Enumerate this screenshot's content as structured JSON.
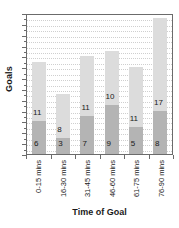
{
  "chart_data": {
    "type": "bar",
    "title": "",
    "subtitle": "",
    "xlabel": "Time of Goal",
    "ylabel": "Goals",
    "stacked": true,
    "orientation": "vertical",
    "grid": true,
    "grid_style": "dotted-horizontal",
    "legend": false,
    "legend_position": "none",
    "y_axis_tick_labels_shown": false,
    "ylim": [
      0,
      26
    ],
    "categories": [
      "0-15 mins",
      "16-30 mins",
      "31-45 mins",
      "46-60 mins",
      "61-75 mins",
      "76-90 mins"
    ],
    "series": [
      {
        "name": "lower-segment",
        "color": "#b4b4b4",
        "values": [
          6,
          3,
          7,
          9,
          5,
          8
        ]
      },
      {
        "name": "upper-segment",
        "color": "#dcdcdc",
        "values": [
          11,
          8,
          11,
          10,
          11,
          17
        ]
      }
    ],
    "totals": [
      17,
      11,
      18,
      19,
      16,
      25
    ],
    "bars": [
      {
        "category": "0-15 mins",
        "bottom_value": 6,
        "top_value": 11,
        "bottom_label": "6",
        "top_label": "11",
        "total": 17
      },
      {
        "category": "16-30 mins",
        "bottom_value": 3,
        "top_value": 8,
        "bottom_label": "3",
        "top_label": "8",
        "total": 11
      },
      {
        "category": "31-45 mins",
        "bottom_value": 7,
        "top_value": 11,
        "bottom_label": "7",
        "top_label": "11",
        "total": 18
      },
      {
        "category": "46-60 mins",
        "bottom_value": 9,
        "top_value": 10,
        "bottom_label": "9",
        "top_label": "10",
        "total": 19
      },
      {
        "category": "61-75 mins",
        "bottom_value": 5,
        "top_value": 11,
        "bottom_label": "5",
        "top_label": "11",
        "total": 16
      },
      {
        "category": "76-90 mins",
        "bottom_value": 8,
        "top_value": 17,
        "bottom_label": "8",
        "top_label": "17",
        "total": 25
      }
    ],
    "colors": {
      "lower_segment": "#b4b4b4",
      "upper_segment": "#dcdcdc",
      "axis": "#6b6b6b",
      "gridline": "#cfcfcf",
      "text": "#1a1a1a",
      "background": "#ffffff"
    }
  }
}
